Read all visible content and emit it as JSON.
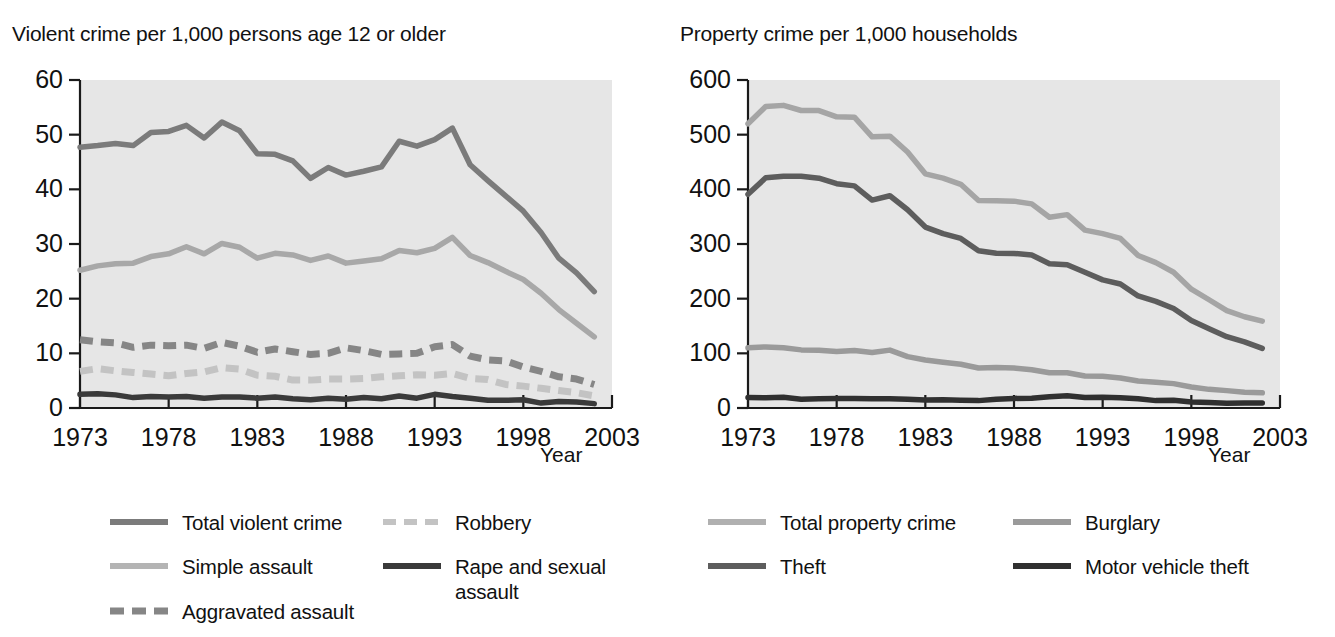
{
  "charts": [
    {
      "panel_id": "violent-crime",
      "title": "Violent crime per 1,000 persons age 12 or older",
      "xlabel": "Year",
      "legend": [
        {
          "label": "Total violent crime",
          "color": "#7b7b7b",
          "dash": false
        },
        {
          "label": "Robbery",
          "color": "#c3c3c3",
          "dash": true
        },
        {
          "label": "Simple assault",
          "color": "#a8a8a8",
          "dash": false
        },
        {
          "label": "Rape and sexual assault",
          "color": "#3a3a3a",
          "dash": false
        },
        {
          "label": "Aggravated assault",
          "color": "#868686",
          "dash": true
        }
      ]
    },
    {
      "panel_id": "property-crime",
      "title": "Property crime per 1,000 households",
      "xlabel": "Year",
      "legend": [
        {
          "label": "Total property crime",
          "color": "#a5a5a5",
          "dash": false
        },
        {
          "label": "Burglary",
          "color": "#9a9a9a",
          "dash": false
        },
        {
          "label": "Theft",
          "color": "#5d5d5d",
          "dash": false
        },
        {
          "label": "Motor vehicle theft",
          "color": "#303030",
          "dash": false
        }
      ]
    }
  ],
  "chart_data": [
    {
      "type": "line",
      "panel_id": "violent-crime",
      "title": "Violent crime per 1,000 persons age 12 or older",
      "xlabel": "Year",
      "ylabel": "",
      "xlim": [
        1973,
        2003
      ],
      "ylim": [
        0,
        60
      ],
      "yticks": [
        0,
        10,
        20,
        30,
        40,
        50,
        60
      ],
      "xticks": [
        1973,
        1978,
        1983,
        1988,
        1993,
        1998,
        2003
      ],
      "grid": false,
      "legend_position": "below",
      "plot_background": "#e6e6e6",
      "x": [
        1973,
        1974,
        1975,
        1976,
        1977,
        1978,
        1979,
        1980,
        1981,
        1982,
        1983,
        1984,
        1985,
        1986,
        1987,
        1988,
        1989,
        1990,
        1991,
        1992,
        1993,
        1994,
        1995,
        1996,
        1997,
        1998,
        1999,
        2000,
        2001,
        2002
      ],
      "series": [
        {
          "name": "Total violent crime",
          "color": "#7b7b7b",
          "dash": false,
          "values": [
            47.7,
            48.0,
            48.4,
            48.0,
            50.4,
            50.6,
            51.7,
            49.4,
            52.3,
            50.7,
            46.5,
            46.4,
            45.2,
            42.0,
            44.0,
            42.6,
            43.3,
            44.1,
            48.8,
            47.9,
            49.1,
            51.2,
            44.5,
            41.6,
            38.8,
            36.0,
            32.1,
            27.4,
            24.7,
            21.3
          ]
        },
        {
          "name": "Simple assault",
          "color": "#a8a8a8",
          "dash": false,
          "values": [
            25.2,
            26.0,
            26.4,
            26.5,
            27.7,
            28.2,
            29.5,
            28.2,
            30.1,
            29.4,
            27.4,
            28.3,
            28.0,
            27.0,
            27.8,
            26.5,
            26.9,
            27.3,
            28.8,
            28.4,
            29.2,
            31.2,
            27.9,
            26.6,
            25.0,
            23.5,
            21.0,
            18.0,
            15.5,
            13.0
          ]
        },
        {
          "name": "Aggravated assault",
          "color": "#868686",
          "dash": true,
          "values": [
            12.5,
            12.1,
            11.9,
            11.1,
            11.5,
            11.4,
            11.5,
            10.9,
            12.0,
            11.3,
            10.2,
            10.8,
            10.3,
            9.8,
            10.0,
            11.0,
            10.5,
            9.8,
            9.9,
            10.0,
            11.2,
            11.6,
            9.5,
            8.8,
            8.6,
            7.5,
            6.7,
            5.7,
            5.3,
            4.3
          ]
        },
        {
          "name": "Robbery",
          "color": "#c3c3c3",
          "dash": true,
          "values": [
            6.7,
            7.2,
            6.8,
            6.5,
            6.2,
            5.9,
            6.3,
            6.6,
            7.4,
            7.1,
            6.0,
            5.8,
            5.1,
            5.1,
            5.3,
            5.3,
            5.4,
            5.7,
            5.9,
            6.1,
            6.0,
            6.3,
            5.4,
            5.2,
            4.3,
            4.0,
            3.6,
            3.2,
            2.8,
            2.2
          ]
        },
        {
          "name": "Rape and sexual assault",
          "color": "#3a3a3a",
          "dash": false,
          "values": [
            2.5,
            2.6,
            2.4,
            1.9,
            2.1,
            2.0,
            2.1,
            1.8,
            2.0,
            2.0,
            1.8,
            2.0,
            1.7,
            1.5,
            1.8,
            1.6,
            1.9,
            1.7,
            2.2,
            1.8,
            2.5,
            2.1,
            1.8,
            1.4,
            1.4,
            1.5,
            0.9,
            1.2,
            1.1,
            0.8
          ]
        }
      ]
    },
    {
      "type": "line",
      "panel_id": "property-crime",
      "title": "Property crime per 1,000 households",
      "xlabel": "Year",
      "ylabel": "",
      "xlim": [
        1973,
        2003
      ],
      "ylim": [
        0,
        600
      ],
      "yticks": [
        0,
        100,
        200,
        300,
        400,
        500,
        600
      ],
      "xticks": [
        1973,
        1978,
        1983,
        1988,
        1993,
        1998,
        2003
      ],
      "grid": false,
      "legend_position": "below",
      "plot_background": "#e6e6e6",
      "x": [
        1973,
        1974,
        1975,
        1976,
        1977,
        1978,
        1979,
        1980,
        1981,
        1982,
        1983,
        1984,
        1985,
        1986,
        1987,
        1988,
        1989,
        1990,
        1991,
        1992,
        1993,
        1994,
        1995,
        1996,
        1997,
        1998,
        1999,
        2000,
        2001,
        2002
      ],
      "series": [
        {
          "name": "Total property crime",
          "color": "#a5a5a5",
          "dash": false,
          "values": [
            519.9,
            551.5,
            553.6,
            544.2,
            544.1,
            532.6,
            532.0,
            496.1,
            497.3,
            468.3,
            428.4,
            420.6,
            409.2,
            379.6,
            379.0,
            378.4,
            373.4,
            348.9,
            353.7,
            325.3,
            318.9,
            310.2,
            279.0,
            266.0,
            248.3,
            217.4,
            198.0,
            178.1,
            166.9,
            159.0
          ]
        },
        {
          "name": "Theft",
          "color": "#5d5d5d",
          "dash": false,
          "values": [
            390.8,
            421.0,
            424.1,
            424.1,
            420.3,
            410.4,
            406.3,
            380.4,
            388.3,
            362.6,
            331.0,
            319.0,
            310.2,
            287.8,
            283.0,
            282.8,
            280.0,
            263.8,
            261.9,
            248.2,
            234.4,
            226.9,
            204.9,
            195.0,
            182.0,
            160.0,
            145.0,
            130.5,
            121.0,
            109.0
          ]
        },
        {
          "name": "Burglary",
          "color": "#9a9a9a",
          "dash": false,
          "values": [
            110.0,
            111.8,
            110.2,
            106.3,
            105.8,
            103.4,
            105.2,
            101.4,
            105.9,
            94.0,
            87.7,
            83.8,
            80.0,
            73.2,
            74.0,
            73.0,
            70.0,
            64.5,
            64.6,
            58.4,
            58.2,
            55.0,
            49.3,
            47.2,
            44.6,
            38.5,
            34.1,
            31.8,
            28.7,
            27.7
          ]
        },
        {
          "name": "Motor vehicle theft",
          "color": "#303030",
          "dash": false,
          "values": [
            19.1,
            18.8,
            19.5,
            16.2,
            17.0,
            17.5,
            17.5,
            16.7,
            17.1,
            16.2,
            14.6,
            15.2,
            14.2,
            13.5,
            16.0,
            17.5,
            18.0,
            20.5,
            22.2,
            19.0,
            19.8,
            18.8,
            16.8,
            13.5,
            14.0,
            10.8,
            10.0,
            8.6,
            9.0,
            9.0
          ]
        }
      ]
    }
  ]
}
